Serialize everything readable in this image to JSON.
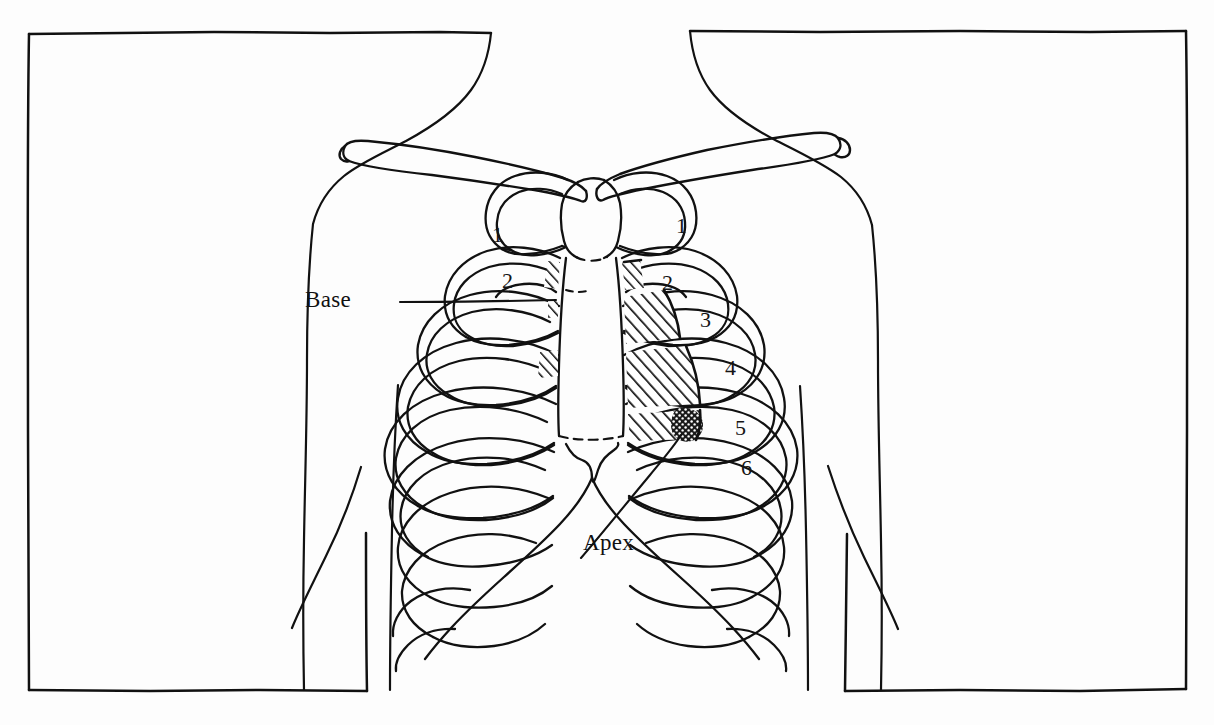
{
  "figure": {
    "kind": "anatomical-line-drawing",
    "background_color": "#fdfdfd",
    "ink_color": "#111111",
    "frame": {
      "present": true,
      "style": "hand-drawn rectangle, broken at top centre for neck and at bottom centre for torso"
    }
  },
  "callouts": [
    {
      "id": "base",
      "label": "Base",
      "points_to": "upper sternal border of cardiac outline"
    },
    {
      "id": "apex",
      "label": "Apex",
      "points_to": "stippled cardiac apex near fifth intercostal space"
    }
  ],
  "rib_numbers": {
    "left_side": [
      {
        "value": "1",
        "x": 492,
        "y": 222
      },
      {
        "value": "2",
        "x": 502,
        "y": 268
      }
    ],
    "right_side": [
      {
        "value": "1",
        "x": 676,
        "y": 213
      },
      {
        "value": "2",
        "x": 662,
        "y": 270
      },
      {
        "value": "3",
        "x": 700,
        "y": 307
      },
      {
        "value": "4",
        "x": 725,
        "y": 355
      },
      {
        "value": "5",
        "x": 735,
        "y": 415
      },
      {
        "value": "6",
        "x": 741,
        "y": 455
      }
    ]
  },
  "shading": {
    "cardiac_area": "diagonal hatching over left parasternal intercostal spaces",
    "cardiac_apex": "dense stipple / cross-hatch patch at inferolateral corner"
  }
}
